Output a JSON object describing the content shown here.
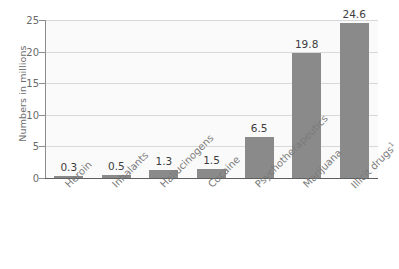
{
  "chart_data": {
    "type": "bar",
    "title": "",
    "xlabel": "",
    "ylabel": "Numbers in millions",
    "categories": [
      "Heroin",
      "Inhalants",
      "Hallucinogens",
      "Cocaine",
      "Psychotherapeutics",
      "Marijuana",
      "Illicit drugs"
    ],
    "category_footnotes": [
      "",
      "",
      "",
      "",
      "",
      "",
      "1"
    ],
    "values": [
      0.3,
      0.5,
      1.3,
      1.5,
      6.5,
      19.8,
      24.6
    ],
    "value_labels": [
      "0.3",
      "0.5",
      "1.3",
      "1.5",
      "6.5",
      "19.8",
      "24.6"
    ],
    "ylim": [
      0,
      25
    ],
    "yticks": [
      0,
      5,
      10,
      15,
      20,
      25
    ],
    "ytick_labels": [
      "0",
      "5",
      "10",
      "15",
      "20",
      "25"
    ],
    "grid": true,
    "legend": "none",
    "bar_color": "#8a8a8a",
    "plot_background": "#fafafa",
    "gridline_color": "#d8d8d8",
    "axis_color": "#5f5f5f",
    "tick_label_color": "#6b6b6b",
    "value_label_color": "#3d3d3d",
    "category_label_color": "#7a7a7a",
    "category_label_rotation": -45
  }
}
